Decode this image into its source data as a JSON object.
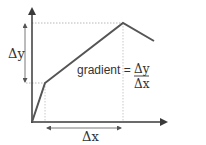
{
  "diagram": {
    "labels": {
      "delta_y": "Δy",
      "delta_x": "Δx",
      "gradient_word": "gradient =",
      "fraction_numerator": "Δy",
      "fraction_denominator": "Δx"
    },
    "colors": {
      "axis": "#3a3a3a",
      "line": "#555555",
      "guides": "#b8b8b8",
      "text": "#333333"
    }
  }
}
